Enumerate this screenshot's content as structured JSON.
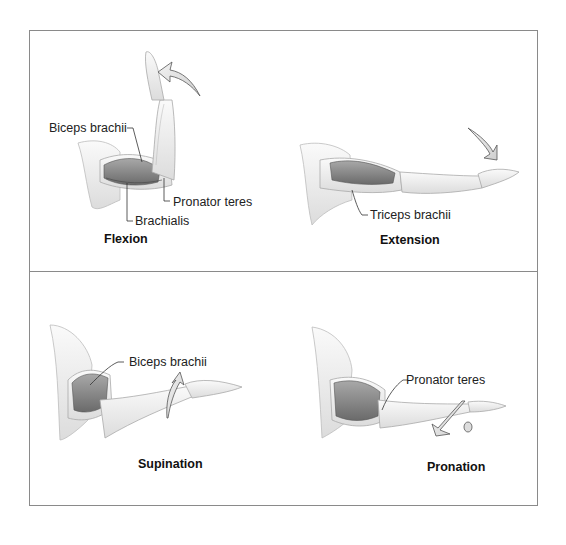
{
  "figure": {
    "panels": [
      {
        "id": "flexion",
        "caption": "Flexion",
        "labels": [
          "Biceps brachii",
          "Pronator teres",
          "Brachialis"
        ]
      },
      {
        "id": "extension",
        "caption": "Extension",
        "labels": [
          "Triceps brachii"
        ]
      },
      {
        "id": "supination",
        "caption": "Supination",
        "labels": [
          "Biceps brachii"
        ]
      },
      {
        "id": "pronation",
        "caption": "Pronation",
        "labels": [
          "Pronator teres"
        ]
      }
    ],
    "colors": {
      "border": "#8a8a8a",
      "skin": "#f1f1f1",
      "muscle": "#8f8f8f",
      "muscle_dark": "#6e6e6e",
      "arrow_fill": "#e4e4e4",
      "arrow_stroke": "#555555",
      "text": "#222222"
    }
  }
}
